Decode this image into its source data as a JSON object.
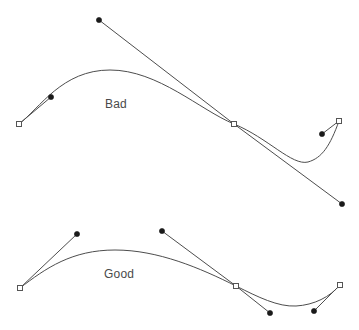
{
  "figure": {
    "background_color": "#ffffff",
    "stroke_color": "#4d4d4d",
    "dot_color": "#1a1a1a",
    "knot_fill_color": "#ffffff",
    "knot_stroke_color": "#555555",
    "label_color": "#4a4a4a",
    "width": 359,
    "height": 330
  },
  "panels": [
    {
      "id": "bad",
      "label": "Bad",
      "label_x": 105,
      "label_y": 108,
      "curve_path": "M 19,124 C 40,108 62,70 110,70 C 158,70 200,110 234,124 C 268,138 292,166 308,162 C 322,158 330,146 339,121",
      "handle_lines": [
        {
          "name": "handle-left",
          "x1": 19,
          "y1": 124,
          "x2": 51,
          "y2": 97
        },
        {
          "name": "handle-incoming",
          "x1": 99,
          "y1": 20,
          "x2": 234,
          "y2": 124
        },
        {
          "name": "handle-outgoing",
          "x1": 234,
          "y1": 124,
          "x2": 342,
          "y2": 204
        },
        {
          "name": "handle-right",
          "x1": 322,
          "y1": 134,
          "x2": 339,
          "y2": 121
        }
      ],
      "control_dots": [
        {
          "name": "control-point-1",
          "x": 51,
          "y": 97
        },
        {
          "name": "control-point-2",
          "x": 99,
          "y": 20
        },
        {
          "name": "control-point-3",
          "x": 342,
          "y": 204
        },
        {
          "name": "control-point-4",
          "x": 322,
          "y": 134
        }
      ],
      "knots": [
        {
          "name": "knot-start",
          "x": 19,
          "y": 124
        },
        {
          "name": "knot-middle",
          "x": 234,
          "y": 124
        },
        {
          "name": "knot-end",
          "x": 339,
          "y": 121
        }
      ]
    },
    {
      "id": "good",
      "label": "Good",
      "label_x": 104,
      "label_y": 278,
      "curve_path": "M 20,288 C 46,268 72,250 115,250 C 158,250 200,268 236,286 C 258,297 278,307 296,306 C 314,305 330,297 340,285",
      "handle_lines": [
        {
          "name": "handle-left",
          "x1": 20,
          "y1": 288,
          "x2": 77,
          "y2": 234
        },
        {
          "name": "handle-incoming",
          "x1": 162,
          "y1": 231,
          "x2": 236,
          "y2": 286
        },
        {
          "name": "handle-outgoing",
          "x1": 236,
          "y1": 286,
          "x2": 270,
          "y2": 313
        },
        {
          "name": "handle-right",
          "x1": 314,
          "y1": 311,
          "x2": 340,
          "y2": 285
        }
      ],
      "control_dots": [
        {
          "name": "control-point-1",
          "x": 77,
          "y": 234
        },
        {
          "name": "control-point-2",
          "x": 162,
          "y": 231
        },
        {
          "name": "control-point-3",
          "x": 270,
          "y": 313
        },
        {
          "name": "control-point-4",
          "x": 314,
          "y": 311
        }
      ],
      "knots": [
        {
          "name": "knot-start",
          "x": 20,
          "y": 288
        },
        {
          "name": "knot-middle",
          "x": 236,
          "y": 286
        },
        {
          "name": "knot-end",
          "x": 340,
          "y": 285
        }
      ]
    }
  ]
}
